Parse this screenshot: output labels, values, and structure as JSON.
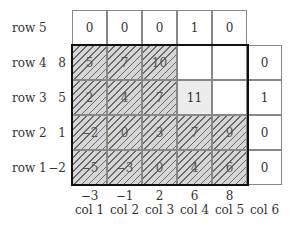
{
  "rows": [
    {
      "label": "row 5",
      "value": ""
    },
    {
      "label": "row 4",
      "value": "8"
    },
    {
      "label": "row 3",
      "value": "5"
    },
    {
      "label": "row 2",
      "value": "1"
    },
    {
      "label": "row 1",
      "value": "−2"
    }
  ],
  "grid": [
    [
      "0",
      "0",
      "0",
      "1",
      "0",
      null
    ],
    [
      "5",
      "7",
      "10",
      "",
      "",
      "0"
    ],
    [
      "2",
      "4",
      "7",
      "11",
      "",
      "1"
    ],
    [
      "−2",
      "0",
      "3",
      "7",
      "9",
      "0"
    ],
    [
      "−5",
      "−3",
      "0",
      "4",
      "6",
      "0"
    ]
  ],
  "columns": [
    {
      "label": "col 1",
      "value": "−3"
    },
    {
      "label": "col 2",
      "value": "−1"
    },
    {
      "label": "col 3",
      "value": "2"
    },
    {
      "label": "col 4",
      "value": "6"
    },
    {
      "label": "col 5",
      "value": "8"
    },
    {
      "label": "col 6",
      "value": ""
    }
  ],
  "colors": {
    "hatch_fill": "#d6d6d6",
    "highlight_cell": "#ececec",
    "thick_border": "#111111"
  }
}
